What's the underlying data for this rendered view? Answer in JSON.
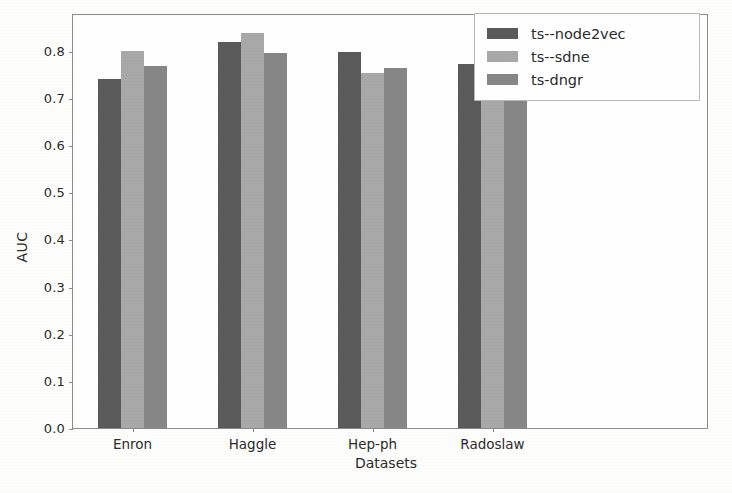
{
  "chart_data": {
    "type": "bar",
    "title": "",
    "xlabel": "Datasets",
    "ylabel": "AUC",
    "categories": [
      "Enron",
      "Haggle",
      "Hep-ph",
      "Radoslaw"
    ],
    "series": [
      {
        "name": "ts--node2vec",
        "color": "#5a5a5a",
        "values": [
          0.74,
          0.818,
          0.797,
          0.772
        ]
      },
      {
        "name": "ts--sdne",
        "color": "#a8a8a8",
        "values": [
          0.799,
          0.838,
          0.753,
          0.747
        ]
      },
      {
        "name": "ts-dngr",
        "color": "#868686",
        "values": [
          0.767,
          0.795,
          0.764,
          0.751
        ]
      }
    ],
    "ylim": [
      0.0,
      0.88
    ],
    "yticks": [
      0.0,
      0.1,
      0.2,
      0.3,
      0.4,
      0.5,
      0.6,
      0.7,
      0.8
    ],
    "ytick_labels": [
      "0.0",
      "0.1",
      "0.2",
      "0.3",
      "0.4",
      "0.5",
      "0.6",
      "0.7",
      "0.8"
    ],
    "grid": false,
    "legend_position": "upper right",
    "bar_width_px": 23,
    "group_pitch_px": 120,
    "group_start_px": 25
  }
}
